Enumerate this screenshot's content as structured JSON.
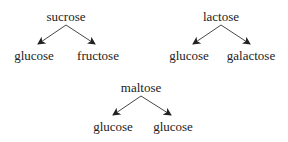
{
  "diagrams": [
    {
      "parent": "sucrose",
      "children": [
        "glucose",
        "fructose"
      ]
    },
    {
      "parent": "lactose",
      "children": [
        "glucose",
        "galactose"
      ]
    },
    {
      "parent": "maltose",
      "children": [
        "glucose",
        "glucose"
      ]
    }
  ]
}
